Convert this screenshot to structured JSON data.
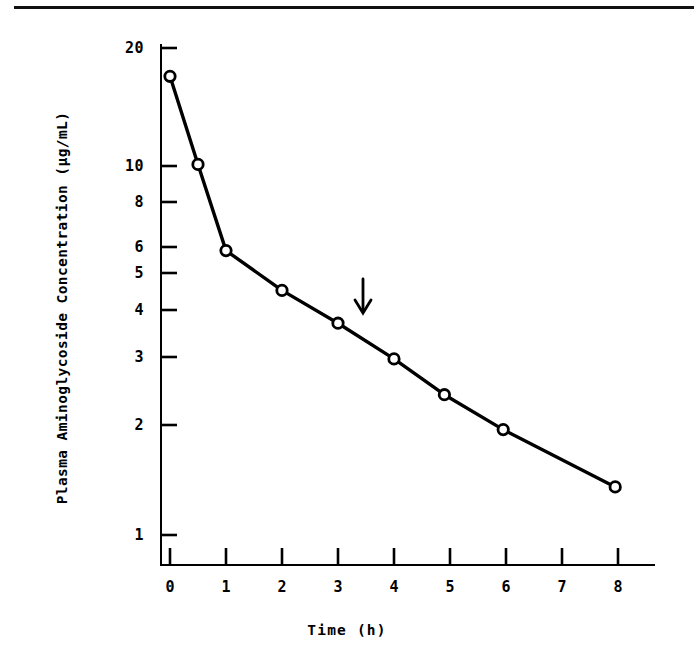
{
  "figure": {
    "background_color": "#ffffff",
    "ink_color": "#000000",
    "top_rule": true
  },
  "axes": {
    "y_tick_labels": [
      "20",
      "10",
      "8",
      "6",
      "5",
      "4",
      "3",
      "2",
      "1"
    ],
    "x_tick_labels": [
      "0",
      "1",
      "2",
      "3",
      "4",
      "5",
      "6",
      "7",
      "8"
    ]
  },
  "annotation": {
    "arrow_label": "down-arrow-marker",
    "arrow_time_h": 3.1,
    "arrow_points_to_concentration": 3.75
  },
  "chart_data": {
    "type": "line",
    "title": "",
    "subtitle": "",
    "xlabel": "Time (h)",
    "ylabel": "Plasma Aminoglycoside Concentration (µg/mL)",
    "yscale": "log",
    "xscale": "linear",
    "xlim": [
      -0.15,
      8.45
    ],
    "ylim": [
      0.8,
      22
    ],
    "grid": false,
    "legend": null,
    "marker": "open-circle",
    "x_ticks": [
      0,
      1,
      2,
      3,
      4,
      5,
      6,
      7,
      8
    ],
    "x_tick_labels": [
      "0",
      "1",
      "2",
      "3",
      "4",
      "5",
      "6",
      "7",
      "8"
    ],
    "y_ticks": [
      1,
      2,
      3,
      4,
      5,
      6,
      8,
      10,
      20
    ],
    "y_tick_labels": [
      "1",
      "2",
      "3",
      "4",
      "5",
      "6",
      "8",
      "10",
      "20"
    ],
    "series": [
      {
        "name": "Plasma aminoglycoside concentration",
        "x": [
          0,
          0.5,
          1,
          2,
          3,
          4,
          4.9,
          5.95,
          7.95
        ],
        "values": [
          17.5,
          10.1,
          5.9,
          4.6,
          3.75,
          3.0,
          2.4,
          1.93,
          1.35
        ]
      }
    ],
    "annotations": [
      {
        "type": "arrow",
        "direction": "down",
        "x": 3.1,
        "y_tip": 3.95,
        "y_tail": 5.1,
        "text": ""
      }
    ]
  }
}
